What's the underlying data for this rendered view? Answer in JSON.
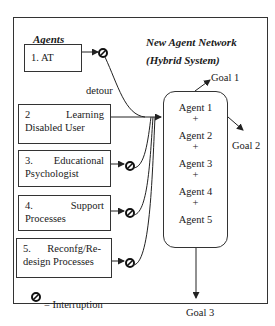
{
  "diagram": {
    "left_section_title": "Agents",
    "right_section_title_line1": "New Agent Network",
    "right_section_title_line2": "(Hybrid System)",
    "agents": [
      {
        "num": "1.",
        "label_line1": "AT",
        "label_line2": ""
      },
      {
        "num": "2",
        "label_line1": "Learning",
        "label_line2": "Disabled User"
      },
      {
        "num": "3.",
        "label_line1": "Educational",
        "label_line2": "Psychologist"
      },
      {
        "num": "4.",
        "label_line1": "Support",
        "label_line2": "Processes"
      },
      {
        "num": "5.",
        "label_line1": "Reconfg/Re-",
        "label_line2": "design Processes"
      }
    ],
    "detour_label": "detour",
    "network_agents": [
      "Agent 1",
      "Agent 2",
      "Agent 3",
      "Agent 4",
      "Agent 5"
    ],
    "plus": "+",
    "goals": [
      "Goal 1",
      "Goal 2",
      "Goal 3"
    ],
    "legend": {
      "icon": "interruption-icon",
      "text": "= Interruption"
    }
  }
}
